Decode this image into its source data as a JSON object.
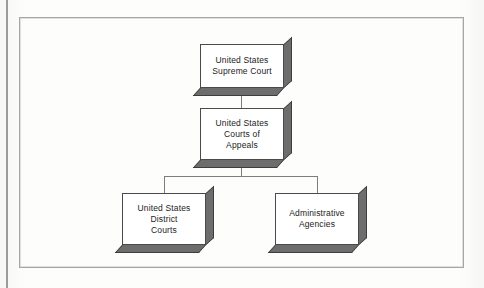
{
  "figure": {
    "kind": "organization-chart",
    "background_color": "#fdfdfb",
    "frame_color": "#a6a6a6",
    "box_face_color": "#ffffff",
    "box_border_color": "#4a4a4a",
    "box_extrusion_color": "#6d6d6d",
    "connector_color": "#7d7d7d",
    "text_color": "#1b1b1b"
  },
  "nodes": [
    {
      "id": "supreme-court",
      "label": "United States\nSupreme Court",
      "level": 1,
      "x": 200,
      "y": 44,
      "w": 84,
      "h": 44
    },
    {
      "id": "courts-of-appeals",
      "label": "United States\nCourts of\nAppeals",
      "level": 2,
      "x": 200,
      "y": 108,
      "w": 84,
      "h": 52
    },
    {
      "id": "district-courts",
      "label": "United States\nDistrict\nCourts",
      "level": 3,
      "x": 122,
      "y": 193,
      "w": 84,
      "h": 52
    },
    {
      "id": "administrative-agencies",
      "label": "Administrative\nAgencies",
      "level": 3,
      "x": 275,
      "y": 193,
      "w": 84,
      "h": 52
    }
  ],
  "edges": [
    {
      "id": "edge-supreme-to-appeals",
      "from": "supreme-court",
      "to": "courts-of-appeals"
    },
    {
      "id": "edge-appeals-to-district",
      "from": "courts-of-appeals",
      "to": "district-courts"
    },
    {
      "id": "edge-appeals-to-agencies",
      "from": "courts-of-appeals",
      "to": "administrative-agencies"
    }
  ],
  "connector_geometry": {
    "stem_x": 241,
    "stem_top_y": 88,
    "stem_mid_y": 108,
    "split_stem_top_y": 160,
    "split_bar_y": 176,
    "split_bar_left_x": 164,
    "split_bar_right_x": 317,
    "drop_bottom_y": 193
  }
}
